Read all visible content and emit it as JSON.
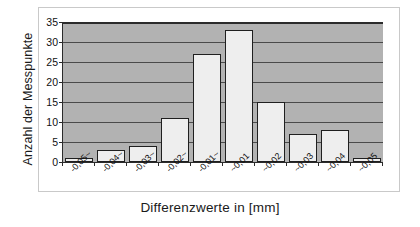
{
  "chart_data": {
    "type": "bar",
    "title": "",
    "subtitle": "",
    "xlabel": "Differenzwerte in [mm]",
    "ylabel": "Anzahl der Messpunkte",
    "categories": [
      "-0,05~",
      "-0,04~",
      "-0,03~",
      "-0,02~",
      "-0,01~",
      "~0,01",
      "~0,02",
      "~0,03",
      "~0,04",
      "~0,05"
    ],
    "values": [
      1,
      3,
      4,
      11,
      27,
      33,
      15,
      7,
      8,
      1
    ],
    "ylim": [
      0,
      35
    ],
    "ytick_values": [
      0,
      5,
      10,
      15,
      20,
      25,
      30,
      35
    ],
    "ytick_labels": [
      "0",
      "5",
      "10",
      "15",
      "20",
      "25",
      "30",
      "35"
    ],
    "grid": "horizontal",
    "legend": "none",
    "plot_background": "#b2b2b2",
    "bar_fill": "#eeeeee",
    "bar_edge": "#1f1f1f",
    "axis_color": "#2b2b2b",
    "gridline_color": "#4a4a4a",
    "frame_color": "#c9c9c9",
    "label_rotation": -45
  }
}
